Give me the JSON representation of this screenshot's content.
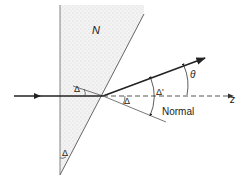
{
  "diagram": {
    "type": "prism-refraction",
    "labels": {
      "medium": "N",
      "apex_angle": "Δ",
      "incidence_angle": "Δ",
      "refraction_angle": "Δ",
      "internal_angle": "Δ'",
      "deviation_angle": "θ",
      "axis": "z",
      "normal": "Normal"
    },
    "colors": {
      "line": "#222222",
      "thin_line": "#555555",
      "prism_fill": "#efefef",
      "stipple": "#b5b5b5",
      "background": "#ffffff"
    }
  }
}
